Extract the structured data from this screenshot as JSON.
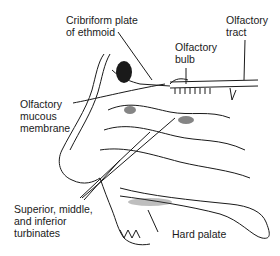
{
  "figure": {
    "labels": {
      "cribriform_line1": "Cribriform plate",
      "cribriform_line2": "of ethmoid",
      "tract_line1": "Olfactory",
      "tract_line2": "tract",
      "bulb_line1": "Olfactory",
      "bulb_line2": "bulb",
      "mucous_line1": "Olfactory",
      "mucous_line2": "mucous",
      "mucous_line3": "membrane",
      "turbinates_line1": "Superior, middle,",
      "turbinates_line2": "and inferior",
      "turbinates_line3": "turbinates",
      "hard_palate": "Hard palate"
    },
    "colors": {
      "ink": "#1a1a1a",
      "background": "#ffffff"
    }
  }
}
